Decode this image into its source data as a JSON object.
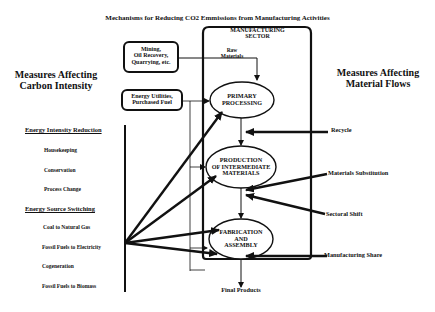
{
  "title": "Mechanisms for Reducing CO2 Emmissions from Manufacturing Activities",
  "left_heading": {
    "line1": "Measures Affecting",
    "line2": "Carbon Intensity"
  },
  "right_heading": {
    "line1": "Measures Affecting",
    "line2": "Material Flows"
  },
  "sector_box": {
    "line1": "MANUFACTURING",
    "line2": "SECTOR"
  },
  "input_boxes": {
    "mining": {
      "line1": "Mining,",
      "line2": "Oil Recovery,",
      "line3": "Quarrying, etc."
    },
    "energy": {
      "line1": "Energy Utilities,",
      "line2": "Purchased Fuel"
    }
  },
  "raw_materials": {
    "line1": "Raw",
    "line2": "Materials"
  },
  "stages": {
    "primary": {
      "line1": "PRIMARY",
      "line2": "PROCESSING"
    },
    "production": {
      "line1": "PRODUCTION",
      "line2": "OF INTERMEDIATE",
      "line3": "MATERIALS"
    },
    "fabrication": {
      "line1": "FABRICATION",
      "line2": "AND",
      "line3": "ASSEMBLY"
    }
  },
  "carbon_measures": {
    "intensity_reduction": {
      "heading": "Energy Intensity Reduction",
      "items": [
        "Housekeeping",
        "Conservation",
        "Process Change"
      ]
    },
    "source_switching": {
      "heading": "Energy  Source Switching",
      "items": [
        "Coal to Natural Gas",
        "Fossil Fuels to Electricity",
        "Cogeneration",
        "Fossil Fuels to Biomass"
      ]
    }
  },
  "material_measures": [
    "Recycle",
    "Materials Substitution",
    "Sectoral Shift",
    "Manufacturing Share"
  ],
  "output": "Final Products"
}
